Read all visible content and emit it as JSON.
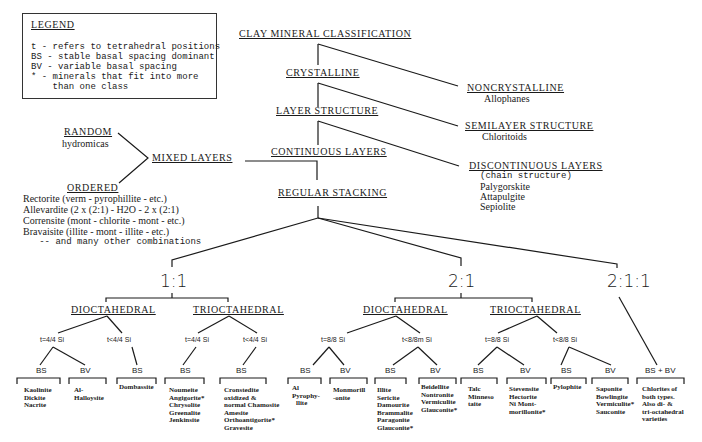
{
  "legend": {
    "title": "LEGEND",
    "lines": [
      "t - refers to tetrahedral positions",
      "BS - stable basal spacing dominant",
      "BV - variable basal spacing",
      "* - minerals that fit into more",
      "    than one class"
    ]
  },
  "tree": {
    "root": "CLAY MINERAL CLASSIFICATION",
    "crystalline": "CRYSTALLINE",
    "noncrystalline": {
      "title": "NONCRYSTALLINE",
      "items": [
        "Allophanes"
      ]
    },
    "layer_structure": "LAYER STRUCTURE",
    "semilayer": {
      "title": "SEMILAYER STRUCTURE",
      "items": [
        "Chloritoids"
      ]
    },
    "continuous_layers": "CONTINUOUS LAYERS",
    "discontinuous": {
      "title": "DISCONTINUOUS LAYERS",
      "items": [
        "(chain structure)",
        "Palygorskite",
        "Attapulgite",
        "Sepiolite"
      ]
    },
    "mixed_layers": "MIXED LAYERS",
    "random": {
      "title": "RANDOM",
      "items": [
        "hydromicas"
      ]
    },
    "ordered": {
      "title": "ORDERED",
      "items": [
        "Rectorite (verm - pyrophillite - etc.)",
        "Allevardite (2 x (2:1) - H2O - 2 x (2:1)",
        "Corrensite (mont - chlorite - mont - etc.)",
        "Bravaisite (illite - mont - illite - etc.)",
        "   -- and many other combinations"
      ]
    },
    "regular_stacking": "REGULAR STACKING",
    "ratios": [
      "1:1",
      "2:1",
      "2:1:1"
    ],
    "octahedral": {
      "di_1": "DIOCTAHEDRAL",
      "tri_1": "TRIOCTAHEDRAL",
      "di_2": "DIOCTAHEDRAL",
      "tri_2": "TRIOCTAHEDRAL"
    },
    "conditions": [
      "t=4/4 Si",
      "t<4/4 Si",
      "t=4/4 Si",
      "t<4/4 Si",
      "t=8/8 Si",
      "t<8/8m Si",
      "t=8/8 Si",
      "t<8/8 Si"
    ],
    "spacing_labels": [
      "BS",
      "BV",
      "BS",
      "BS",
      "BS",
      "BS",
      "BV",
      "BS",
      "BV",
      "BS",
      "BV",
      "BS",
      "BV",
      "BS + BV"
    ],
    "leaves": [
      [
        "Kaolinite",
        "Dickite",
        "Nacrite"
      ],
      [
        "Al-",
        "Halloysite"
      ],
      [
        "Dombassite"
      ],
      [
        "Noumeite",
        "Angigorite*",
        "Chrysolite",
        "Greenalite",
        "Jenkinsite"
      ],
      [
        "Cronstedite",
        "oxidized &",
        "normal Chamosite",
        "Amesite",
        "Orthoantigorite*",
        "Gravesite"
      ],
      [
        "Al",
        "Pyrophy-",
        "llite"
      ],
      [
        "Monmorill",
        "-onite"
      ],
      [
        "Illite",
        "Sericite",
        "Damourite",
        "Brammalite",
        "Paragonite",
        "Glauconite*"
      ],
      [
        "Beidellite",
        "Nontronite",
        "Vermiculite",
        "Glauconite*"
      ],
      [
        "Talc",
        "Minneso",
        "taite"
      ],
      [
        "Stevensite",
        "Hectorite",
        "Ni Mont-",
        "morillonite*"
      ],
      [
        "Pylophite"
      ],
      [
        "Saponite",
        "Bowlingite",
        "Vermiculite*",
        "Sauconite"
      ],
      [
        "Chlorites of",
        "both types.",
        "Also di- &",
        "tri-octahedral",
        "varieties"
      ]
    ]
  }
}
